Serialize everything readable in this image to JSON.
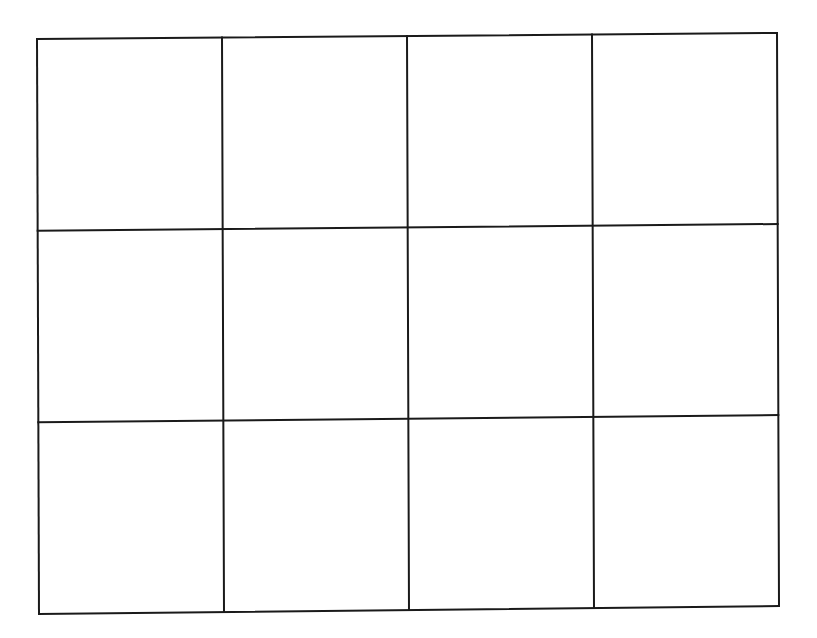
{
  "document": {
    "type": "blank grid worksheet",
    "grid": {
      "columns": 4,
      "rows": 3,
      "cells": [
        [
          "",
          "",
          "",
          ""
        ],
        [
          "",
          "",
          "",
          ""
        ],
        [
          "",
          "",
          "",
          ""
        ]
      ]
    },
    "line_color": "#1a1a1a",
    "background_color": "#ffffff"
  }
}
